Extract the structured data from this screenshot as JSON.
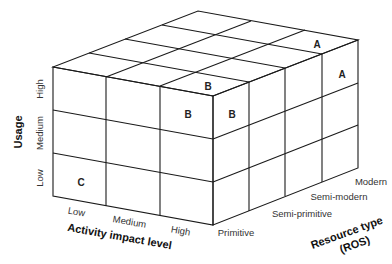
{
  "diagram": {
    "type": "3d-cube-matrix",
    "axes": {
      "vertical": {
        "title": "Usage",
        "ticks": [
          "Low",
          "Medium",
          "High"
        ]
      },
      "horizontal": {
        "title": "Activity impact level",
        "ticks": [
          "Low",
          "Medium",
          "High"
        ]
      },
      "depth": {
        "title_line1": "Resource type",
        "title_line2": "(ROS)",
        "ticks": [
          "Primitive",
          "Semi-primitive",
          "Semi-modern",
          "Modern"
        ]
      }
    },
    "cells": [
      {
        "face": "front",
        "activity": "Low",
        "usage": "Low",
        "label": "C"
      },
      {
        "face": "front",
        "activity": "High",
        "usage": "High",
        "label": "B"
      },
      {
        "face": "top",
        "activity": "High",
        "resource": "Primitive",
        "label": "B"
      },
      {
        "face": "right",
        "resource": "Primitive",
        "usage": "High",
        "label": "B"
      },
      {
        "face": "top",
        "activity": "High",
        "resource": "Modern",
        "label": "A"
      },
      {
        "face": "right",
        "resource": "Modern",
        "usage": "High",
        "label": "A"
      }
    ],
    "colors": {
      "line": "#1a1a1a",
      "text": "#333333",
      "background": "#ffffff"
    }
  }
}
